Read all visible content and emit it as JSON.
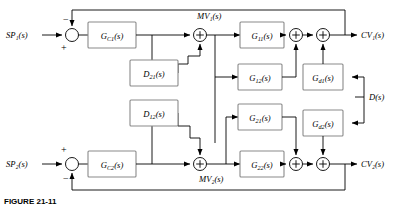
{
  "figure": {
    "caption": "FIGURE 21-11",
    "kind": "block-diagram"
  },
  "inputs": {
    "sp1": "SP₁(s)",
    "sp2": "SP₂(s)",
    "disturbance": "D(s)"
  },
  "outputs": {
    "cv1": "CV₁(s)",
    "cv2": "CV₂(s)"
  },
  "signals": {
    "mv1": "MV₁(s)",
    "mv2": "MV₂(s)"
  },
  "signs": {
    "sp1_minus": "−",
    "sp1_plus": "+",
    "sp2_plus": "+",
    "sp2_minus": "−",
    "sum_plus": "+"
  },
  "blocks": [
    {
      "id": "gc1",
      "label": "G",
      "sub": "C1",
      "arg": "(s)",
      "role": "controller-1"
    },
    {
      "id": "gc2",
      "label": "G",
      "sub": "C2",
      "arg": "(s)",
      "role": "controller-2"
    },
    {
      "id": "d21",
      "label": "D",
      "sub": "21",
      "arg": "(s)",
      "role": "decoupler-21"
    },
    {
      "id": "d12",
      "label": "D",
      "sub": "12",
      "arg": "(s)",
      "role": "decoupler-12"
    },
    {
      "id": "g11",
      "label": "G",
      "sub": "11",
      "arg": "(s)",
      "role": "process-11"
    },
    {
      "id": "g12",
      "label": "G",
      "sub": "12",
      "arg": "(s)",
      "role": "process-12"
    },
    {
      "id": "g21",
      "label": "G",
      "sub": "21",
      "arg": "(s)",
      "role": "process-21"
    },
    {
      "id": "g22",
      "label": "G",
      "sub": "22",
      "arg": "(s)",
      "role": "process-22"
    },
    {
      "id": "gd1",
      "label": "G",
      "sub": "d1",
      "arg": "(s)",
      "role": "disturbance-1"
    },
    {
      "id": "gd2",
      "label": "G",
      "sub": "d2",
      "arg": "(s)",
      "role": "disturbance-2"
    }
  ],
  "colors": {
    "block_stroke": "#8a8a8a",
    "wire": "#000000",
    "background": "#ffffff"
  }
}
